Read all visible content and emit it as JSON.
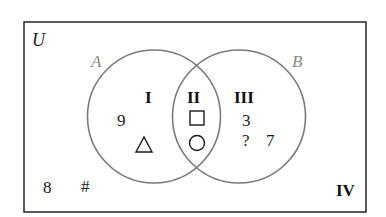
{
  "diagram": {
    "type": "venn",
    "universe_label": "U",
    "sets": [
      {
        "label": "A",
        "color": "#888888"
      },
      {
        "label": "B",
        "color": "#888888"
      }
    ],
    "regions": {
      "I": {
        "label": "I",
        "elements": [
          "9",
          "△"
        ]
      },
      "II": {
        "label": "II",
        "elements": [
          "□",
          "○"
        ]
      },
      "III": {
        "label": "III",
        "elements": [
          "3",
          "?",
          "7"
        ]
      },
      "IV": {
        "label": "IV",
        "elements": [
          "8",
          "#"
        ]
      }
    },
    "colors": {
      "frame": "#333333",
      "circle": "#7a7a7a",
      "text": "#1a1a1a"
    }
  }
}
